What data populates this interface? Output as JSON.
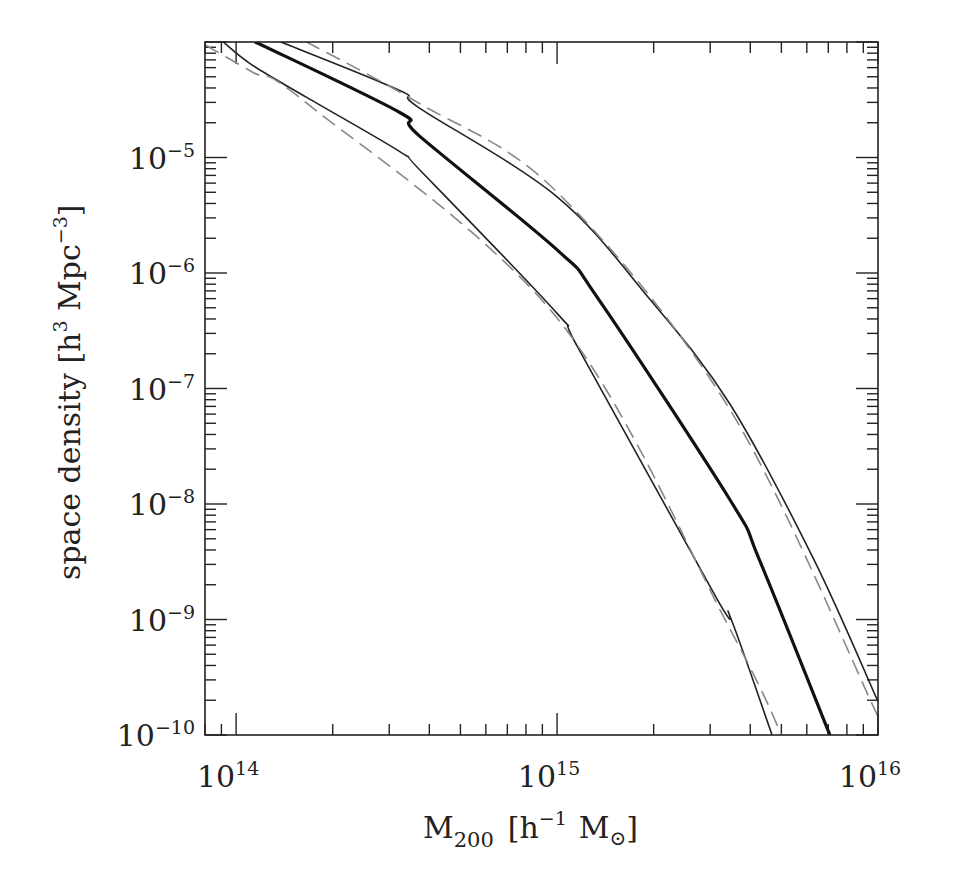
{
  "chart_data": {
    "type": "line",
    "title": "",
    "xlabel": "M_200 [h^-1 M_sun]",
    "ylabel": "space density [h^3 Mpc^-3]",
    "xscale": "log",
    "yscale": "log",
    "xlim": [
      80000000000000.0,
      1e+16
    ],
    "ylim": [
      1e-10,
      0.0001
    ],
    "grid": false,
    "legend": null,
    "x_ticks": [
      {
        "base": "10",
        "exp": "14",
        "value": 100000000000000.0
      },
      {
        "base": "10",
        "exp": "15",
        "value": 1000000000000000.0
      },
      {
        "base": "10",
        "exp": "16",
        "value": 1e+16
      }
    ],
    "y_ticks": [
      {
        "base": "10",
        "exp": "−5",
        "value": 1e-05
      },
      {
        "base": "10",
        "exp": "−6",
        "value": 1e-06
      },
      {
        "base": "10",
        "exp": "−7",
        "value": 1e-07
      },
      {
        "base": "10",
        "exp": "−8",
        "value": 1e-08
      },
      {
        "base": "10",
        "exp": "−9",
        "value": 1e-09
      },
      {
        "base": "10",
        "exp": "−10",
        "value": 1e-10
      }
    ],
    "series": [
      {
        "name": "lower (solid)",
        "style": "solid",
        "color": "#222222",
        "width": 1.6,
        "log_x": [
          13.96,
          14.05,
          14.22,
          14.51,
          14.58,
          15.0,
          15.07,
          15.5,
          15.54,
          15.67
        ],
        "log_y": [
          -4.0,
          -4.2,
          -4.48,
          -4.95,
          -5.13,
          -6.35,
          -6.67,
          -8.83,
          -8.98,
          -10.0
        ]
      },
      {
        "name": "central (thick)",
        "style": "solid",
        "color": "#111111",
        "width": 3.2,
        "log_x": [
          14.06,
          14.51,
          14.57,
          15.0,
          15.13,
          15.54,
          15.63,
          15.85
        ],
        "log_y": [
          -4.0,
          -4.61,
          -4.81,
          -5.8,
          -6.23,
          -7.97,
          -8.48,
          -10.0
        ]
      },
      {
        "name": "upper (solid)",
        "style": "solid",
        "color": "#222222",
        "width": 1.6,
        "log_x": [
          14.14,
          14.51,
          14.57,
          15.0,
          15.29,
          15.54,
          15.8,
          16.0
        ],
        "log_y": [
          -4.0,
          -4.42,
          -4.57,
          -5.34,
          -6.23,
          -7.14,
          -8.48,
          -9.71
        ]
      },
      {
        "name": "upper (dashed)",
        "style": "dashed",
        "color": "#888888",
        "width": 1.6,
        "log_x": [
          14.22,
          14.57,
          15.0,
          15.54,
          16.0
        ],
        "log_y": [
          -4.0,
          -4.53,
          -5.3,
          -7.19,
          -9.84
        ]
      },
      {
        "name": "lower (dashed)",
        "style": "dashed",
        "color": "#888888",
        "width": 1.6,
        "log_x": [
          13.907,
          14.05,
          14.22,
          15.0,
          15.54,
          15.7
        ],
        "log_y": [
          -4.03,
          -4.26,
          -4.53,
          -6.39,
          -9.09,
          -10.0
        ]
      }
    ]
  },
  "axes": {
    "x_label_main": "M",
    "x_label_sub": "200",
    "x_label_unit_open": "[h",
    "x_label_unit_exp": "−1",
    "x_label_unit_mass": "M",
    "x_label_unit_sun": "⊙",
    "x_label_unit_close": "]",
    "y_label_text": "space density [h",
    "y_label_exp1": "3",
    "y_label_mid": " Mpc",
    "y_label_exp2": "−3",
    "y_label_close": "]"
  }
}
